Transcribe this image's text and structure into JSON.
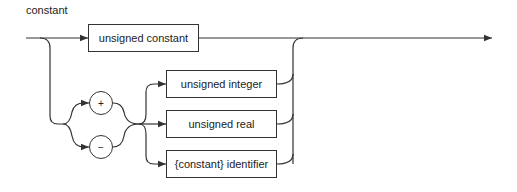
{
  "diagram": {
    "title": "constant",
    "type": "syntax-diagram",
    "nodes": {
      "unsigned_constant": "unsigned constant",
      "plus": "+",
      "minus": "−",
      "unsigned_integer": "unsigned integer",
      "unsigned_real": "unsigned real",
      "constant_identifier": "{constant} identifier"
    }
  }
}
